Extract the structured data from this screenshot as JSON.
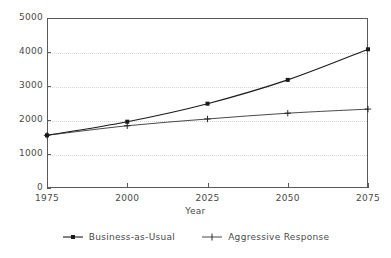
{
  "chart_data": {
    "type": "line",
    "title": "",
    "xlabel": "Year",
    "ylabel": "",
    "x": [
      1975,
      2000,
      2025,
      2050,
      2075
    ],
    "xticklabels": [
      "1975",
      "2000",
      "2025",
      "2050",
      "2075"
    ],
    "yticklabels": [
      "0",
      "1000",
      "2000",
      "3000",
      "4000",
      "5000"
    ],
    "yticks": [
      0,
      1000,
      2000,
      3000,
      4000,
      5000
    ],
    "xlim": [
      1975,
      2075
    ],
    "ylim": [
      0,
      5000
    ],
    "grid": "horizontal-dotted",
    "legend_position": "bottom-center",
    "series": [
      {
        "name": "Business-as-Usual",
        "marker": "square",
        "color": "#1a1a1a",
        "values": [
          1550,
          1950,
          2480,
          3180,
          4080
        ]
      },
      {
        "name": "Aggressive Response",
        "marker": "plus",
        "color": "#1a1a1a",
        "values": [
          1550,
          1830,
          2030,
          2200,
          2320
        ]
      }
    ]
  },
  "legend": {
    "entries": [
      {
        "label": "Business-as-Usual",
        "marker": "square-marker-icon"
      },
      {
        "label": "Aggressive Response",
        "marker": "plus-marker-icon"
      }
    ]
  },
  "axis": {
    "x_label": "Year"
  }
}
